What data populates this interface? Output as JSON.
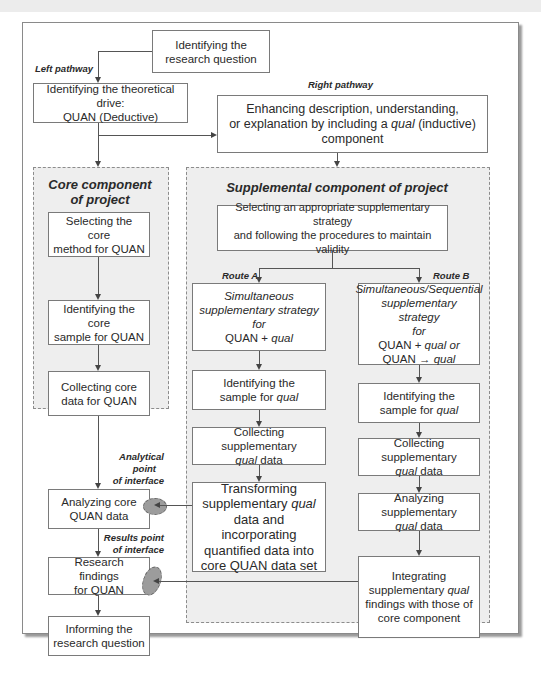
{
  "labels": {
    "left_pathway": "Left pathway",
    "right_pathway": "Right pathway",
    "route_a": "Route A",
    "route_b": "Route B",
    "analytical_point": [
      "Analytical",
      "point",
      "of interface"
    ],
    "results_point": [
      "Results point",
      "of interface"
    ]
  },
  "panels": {
    "core_title": [
      "Core component",
      "of project"
    ],
    "supplemental_title": "Supplemental component of project"
  },
  "boxes": {
    "research_question": [
      "Identifying the",
      "research question"
    ],
    "theoretical_drive": [
      "Identifying the theoretical drive:",
      "QUAN (Deductive)"
    ],
    "enhancing": {
      "line1": "Enhancing description, understanding,",
      "line2_pre": "or explanation by including a ",
      "line2_italic": "qual",
      "line2_post": " (inductive)",
      "line3": "component"
    },
    "core_method": [
      "Selecting the core",
      "method for QUAN"
    ],
    "core_sample": [
      "Identifying the core",
      "sample for QUAN"
    ],
    "core_collect": [
      "Collecting core",
      "data for QUAN"
    ],
    "core_analyze": [
      "Analyzing core",
      "QUAN data"
    ],
    "core_findings": [
      "Research findings",
      "for QUAN"
    ],
    "informing": [
      "Informing the",
      "research question"
    ],
    "select_strategy": [
      "Selecting an appropriate supplementary strategy",
      "and following the procedures to maintain validity"
    ],
    "route_a_strategy": {
      "l1": "Simultaneous",
      "l2": "supplementary strategy",
      "l3": "for",
      "l4_pre": "QUAN + ",
      "l4_italic": "qual"
    },
    "route_b_strategy": {
      "l1": "Simultaneous/Sequential",
      "l2": "supplementary strategy",
      "l3": "for",
      "l4_pre": "QUAN + ",
      "l4_italic": "qual or",
      "l5_pre": "QUAN → ",
      "l5_italic": "qual"
    },
    "a_sample": {
      "l1": "Identifying the",
      "l2_pre": "sample for ",
      "l2_italic": "qual"
    },
    "a_collect": {
      "l1": "Collecting supplementary",
      "l2_italic": "qual",
      "l2_post": " data"
    },
    "a_transform": {
      "l1": "Transforming",
      "l2_pre": "supplementary ",
      "l2_italic": "qual",
      "l3": "data and incorporating",
      "l4": "quantified data into",
      "l5": "core QUAN data set"
    },
    "b_sample": {
      "l1": "Identifying the",
      "l2_pre": "sample for ",
      "l2_italic": "qual"
    },
    "b_collect": {
      "l1": "Collecting supplementary",
      "l2_italic": "qual",
      "l2_post": " data"
    },
    "b_analyze": {
      "l1": "Analyzing supplementary",
      "l2_italic": "qual",
      "l2_post": " data"
    },
    "b_integrate": {
      "l1": "Integrating",
      "l2_pre": "supplementary ",
      "l2_italic": "qual",
      "l3": "findings with those of",
      "l4": "core component"
    }
  },
  "colors": {
    "panel_fill": "#eeeeee",
    "ellipse_fill": "#9c9c9c",
    "border": "#7a7a7a"
  }
}
